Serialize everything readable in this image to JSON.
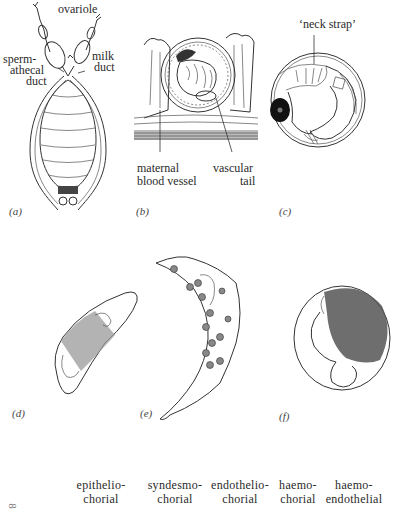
{
  "figure": {
    "panels": [
      {
        "id": "a",
        "label": "(a)",
        "callouts": {
          "ovariole": "ovariole",
          "spermathecal_line1": "sperm-",
          "spermathecal_line2": "athecal",
          "spermathecal_line3": "duct",
          "milk_line1": "milk",
          "milk_line2": "duct"
        }
      },
      {
        "id": "b",
        "label": "(b)",
        "callouts": {
          "maternal_line1": "maternal",
          "maternal_line2": "blood vessel",
          "vascular_line1": "vascular",
          "vascular_line2": "tail"
        }
      },
      {
        "id": "c",
        "label": "(c)",
        "callouts": {
          "neck_strap": "‘neck strap’"
        }
      },
      {
        "id": "d",
        "label": "(d)"
      },
      {
        "id": "e",
        "label": "(e)"
      },
      {
        "id": "f",
        "label": "(f)"
      }
    ],
    "placenta_types": [
      {
        "line1": "epithelio-",
        "line2": "chorial"
      },
      {
        "line1": "syndesmo-",
        "line2": "chorial"
      },
      {
        "line1": "endothelio-",
        "line2": "chorial"
      },
      {
        "line1": "haemo-",
        "line2": "chorial"
      },
      {
        "line1": "haemo-",
        "line2": "endothelial"
      }
    ],
    "row_marker": "8"
  }
}
